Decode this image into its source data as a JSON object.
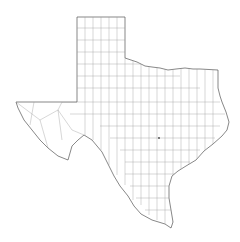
{
  "map": {
    "subject": "Texas counties outline map",
    "colors": {
      "background": "#ffffff",
      "state_border": "#555555",
      "county_border": "#9a9a9a"
    },
    "markers": [
      {
        "name": "city-dot",
        "x": 159,
        "y": 138
      }
    ]
  }
}
